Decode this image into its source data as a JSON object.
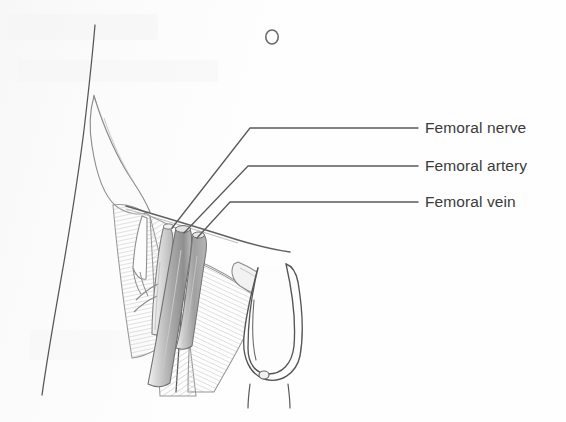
{
  "figure": {
    "view": "anterior view of lower abdomen, groin and upper thigh",
    "background_color": "#fefefe",
    "ink_color": "#4a4a4a",
    "label_text_color": "#3b3b3b",
    "shade_light": "#eeeeee",
    "shade_mid": "#c9c9c9",
    "shade_dark": "#9a9a9a"
  },
  "callouts": [
    {
      "id": "femoral-nerve",
      "label": "Femoral nerve",
      "leader_start_x": 172,
      "leader_start_y": 228,
      "leader_elbow_x": 250,
      "leader_elbow_y": 128,
      "leader_end_x": 418,
      "leader_end_y": 128
    },
    {
      "id": "femoral-artery",
      "label": "Femoral artery",
      "leader_start_x": 184,
      "leader_start_y": 233,
      "leader_elbow_x": 248,
      "leader_elbow_y": 166,
      "leader_end_x": 418,
      "leader_end_y": 166
    },
    {
      "id": "femoral-vein",
      "label": "Femoral vein",
      "leader_start_x": 197,
      "leader_start_y": 238,
      "leader_elbow_x": 230,
      "leader_elbow_y": 202,
      "leader_end_x": 418,
      "leader_end_y": 202
    }
  ],
  "anatomy": {
    "navel": {
      "cx": 272,
      "cy": 37,
      "rx": 6,
      "ry": 7
    },
    "scrotum_dimple": {
      "cx": 264,
      "cy": 375,
      "rx": 5,
      "ry": 4
    },
    "structures": [
      "abdominal wall contour",
      "iliac crest",
      "inguinal ligament",
      "femoral nerve",
      "femoral artery",
      "femoral vein",
      "tensor fasciae latae",
      "sartorius",
      "adductor longus",
      "scrotum",
      "penis",
      "thigh outline"
    ]
  }
}
